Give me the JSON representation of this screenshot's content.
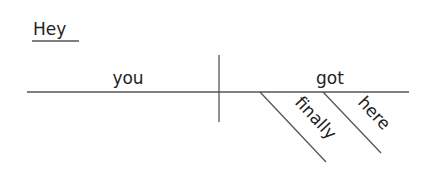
{
  "diagram": {
    "type": "Reed-Kellogg sentence diagram",
    "sentence": "Hey you finally got here",
    "interjection": "Hey",
    "subject": "you",
    "verb": "got",
    "modifiers": [
      "finally",
      "here"
    ]
  },
  "colors": {
    "line": "#555555",
    "text": "#222222",
    "background": "#ffffff"
  }
}
